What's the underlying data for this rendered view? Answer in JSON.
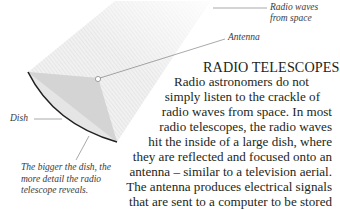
{
  "illustration": {
    "labels": {
      "radio_waves": [
        "Radio waves",
        "from space"
      ],
      "antenna": "Antenna",
      "dish": "Dish",
      "caption": [
        "The bigger the dish, the",
        "more detail the radio",
        "telescope reveals."
      ]
    },
    "colors": {
      "beam": "#e6e6e6",
      "dish_fill": "#d9d9d9",
      "dish_rim": "#231f20",
      "leader": "#6d6e71"
    }
  },
  "article": {
    "title": "RADIO TELESCOPES",
    "lines": [
      "Radio astronomers do not",
      "simply listen to the crackle of",
      "radio waves from space. In most",
      "radio telescopes, the radio waves",
      "hit the inside of a large dish, where",
      "they are reflected and focused onto an",
      "antenna – similar to a television aerial.",
      "The antenna produces electrical signals",
      "that are sent to a computer to be stored",
      "and converted into electronic images."
    ]
  }
}
